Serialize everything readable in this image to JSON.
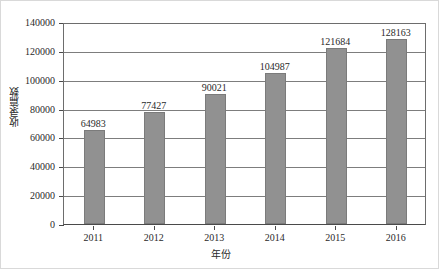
{
  "chart_data": {
    "type": "bar",
    "title": "",
    "xlabel": "年份",
    "ylabel": "收录篇数",
    "categories": [
      "2011",
      "2012",
      "2013",
      "2014",
      "2015",
      "2016"
    ],
    "values": [
      64983,
      77427,
      90021,
      104987,
      121684,
      128163
    ],
    "data_labels": [
      "64983",
      "77427",
      "90021",
      "104987",
      "121684",
      "128163"
    ],
    "ylim": [
      0,
      140000
    ],
    "ytick_labels": [
      "0",
      "20000",
      "40000",
      "60000",
      "80000",
      "100000",
      "120000",
      "140000"
    ],
    "ytick_values": [
      0,
      20000,
      40000,
      60000,
      80000,
      100000,
      120000,
      140000
    ],
    "grid": true,
    "legend": null,
    "series_color": "#919191",
    "axis_color": "#4a4a4a",
    "grid_color": "#7d7d7d"
  }
}
